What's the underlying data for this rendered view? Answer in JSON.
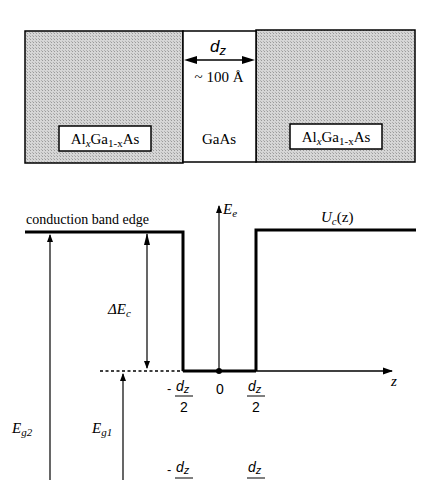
{
  "structure": {
    "left_layer": {
      "label_main": "Al",
      "sub1": "x",
      "mid": "Ga",
      "sub2": "1-x",
      "end": "As"
    },
    "center_layer": {
      "label": "GaAs",
      "width_label": "d",
      "width_sub": "z",
      "thickness": "~ 100 Å"
    },
    "right_layer": {
      "label_main": "Al",
      "sub1": "x",
      "mid": "Ga",
      "sub2": "1-x",
      "end": "As"
    },
    "fill_color": "#c8c8c8"
  },
  "band_diagram": {
    "conduction_band_label": "conduction band edge",
    "energy_axis_label": "E",
    "energy_axis_sub": "e",
    "potential_label": "U",
    "potential_sub": "c",
    "potential_arg": "(z)",
    "delta_ec": "ΔE",
    "delta_ec_sub": "c",
    "eg2": "E",
    "eg2_sub": "g2",
    "eg1": "E",
    "eg1_sub": "g1",
    "z_axis_label": "z",
    "tick_neg": {
      "sign": "-",
      "num": "d",
      "num_sub": "z",
      "den": "2"
    },
    "tick_zero": "0",
    "tick_pos": {
      "num": "d",
      "num_sub": "z",
      "den": "2"
    },
    "bottom_tick_neg": {
      "sign": "-",
      "num": "d",
      "num_sub": "z"
    },
    "bottom_tick_pos": {
      "num": "d",
      "num_sub": "z"
    }
  }
}
